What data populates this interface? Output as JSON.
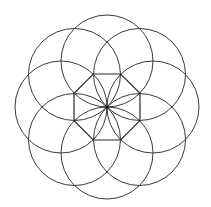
{
  "diagram": {
    "type": "geometric-rosette",
    "center": [
      107,
      107
    ],
    "circles": {
      "count": 8,
      "radius": 46,
      "center_distance": 46,
      "start_angle_deg": -90,
      "stroke": "#3a3a3a"
    },
    "octagon": {
      "sides": 8,
      "circumradius": 35.7,
      "rotation_deg": 22.5,
      "stroke": "#2a2a2a"
    },
    "background": "#ffffff"
  }
}
